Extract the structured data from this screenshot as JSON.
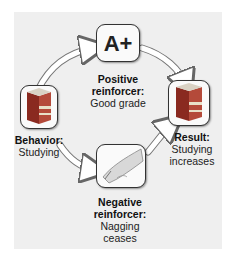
{
  "diagram": {
    "positive": {
      "title": "Positive reinforcer:",
      "title_line1": "Positive",
      "title_line2": "reinforcer:",
      "text": "Good grade",
      "icon_text": "A+"
    },
    "behavior": {
      "title": "Behavior:",
      "text": "Studying"
    },
    "result": {
      "title": "Result:",
      "text_line1": "Studying",
      "text_line2": "increases"
    },
    "negative": {
      "title_line1": "Negative",
      "title_line2": "reinforcer:",
      "text_line1": "Nagging",
      "text_line2": "ceases"
    }
  }
}
